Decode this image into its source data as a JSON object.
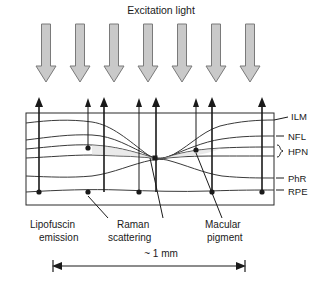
{
  "figure": {
    "title": "Excitation light",
    "scale_label": "~ 1 mm"
  },
  "layers": [
    {
      "key": "ilm",
      "label": "ILM"
    },
    {
      "key": "nfl",
      "label": "NFL"
    },
    {
      "key": "hpn",
      "label": "HPN"
    },
    {
      "key": "phr",
      "label": "PhR"
    },
    {
      "key": "rpe",
      "label": "RPE"
    }
  ],
  "annotations": [
    {
      "key": "lipofuscin",
      "line1": "Lipofuscin",
      "line2": "emission"
    },
    {
      "key": "raman",
      "line1": "Raman",
      "line2": "scattering"
    },
    {
      "key": "macular",
      "line1": "Macular",
      "line2": "pigment"
    }
  ],
  "colors": {
    "stroke": "#1a1a1a",
    "arrow_fill": "#c9c9c9",
    "arrow_stroke": "#7a7a7a",
    "curve": "#3a3a3a",
    "frame": "#2a2a2a",
    "background": "#ffffff"
  },
  "excitation_arrows": {
    "count": 7,
    "x_positions": [
      46,
      80,
      114,
      148,
      182,
      216,
      250
    ]
  },
  "emission_arrows": {
    "count": 8,
    "x_positions": [
      39,
      88,
      104,
      139,
      156,
      196,
      212,
      262
    ]
  },
  "source_dots": {
    "rpe_dots_x": [
      39,
      88,
      139,
      212,
      262
    ],
    "pigment_dots_x": [
      88,
      196
    ],
    "center_dot_x": 156
  }
}
